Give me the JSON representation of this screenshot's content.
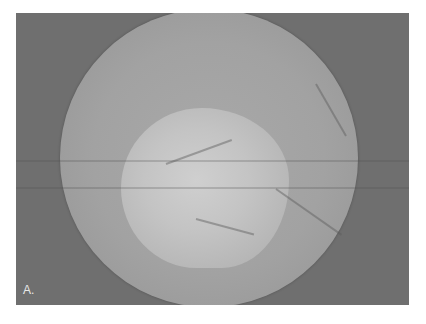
{
  "figure": {
    "panel_label": "A.",
    "colors": {
      "background": "#6f6f6f",
      "disc": "#a2a2a2",
      "highlight": "#cfcfcf",
      "page": "#ffffff"
    }
  }
}
